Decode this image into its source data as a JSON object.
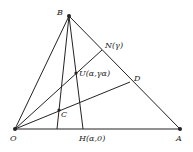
{
  "diagram": {
    "points": {
      "O": {
        "label": "O",
        "x": 15,
        "y": 129
      },
      "A": {
        "label": "A",
        "x": 180,
        "y": 129
      },
      "B": {
        "label": "B",
        "x": 69,
        "y": 16
      },
      "N": {
        "label": "N(γ)",
        "x": 102,
        "y": 50
      },
      "D": {
        "label": "D",
        "x": 130,
        "y": 82
      },
      "U": {
        "label": "U(α,γα)",
        "x": 76,
        "y": 73
      },
      "C": {
        "label": "C",
        "x": 59,
        "y": 110
      },
      "H": {
        "label": "H(α,0)",
        "x": 83,
        "y": 129
      }
    },
    "stroke_color": "#222222"
  }
}
